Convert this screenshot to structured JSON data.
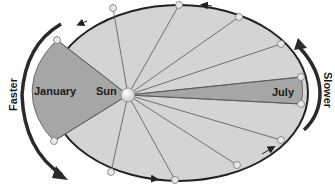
{
  "diagram": {
    "labels": {
      "sun": "Sun",
      "january": "January",
      "july": "July",
      "faster": "Faster",
      "slower": "Slower"
    },
    "colors": {
      "orbit_fill": "#d4d4d4",
      "highlight_fill": "#a6a6a6",
      "orbit_stroke": "#222222",
      "spoke_stroke": "#555555",
      "planet_fill": "#e8e8e8",
      "arrow": "#333333"
    },
    "sun": {
      "x": 128,
      "y": 95
    },
    "planets": [
      {
        "x": 57,
        "y": 40
      },
      {
        "x": 113,
        "y": 8
      },
      {
        "x": 179,
        "y": 5
      },
      {
        "x": 239,
        "y": 17
      },
      {
        "x": 281,
        "y": 44
      },
      {
        "x": 301,
        "y": 77
      },
      {
        "x": 301,
        "y": 104
      },
      {
        "x": 281,
        "y": 140
      },
      {
        "x": 237,
        "y": 165
      },
      {
        "x": 175,
        "y": 180
      },
      {
        "x": 111,
        "y": 172
      },
      {
        "x": 54,
        "y": 141
      }
    ]
  }
}
